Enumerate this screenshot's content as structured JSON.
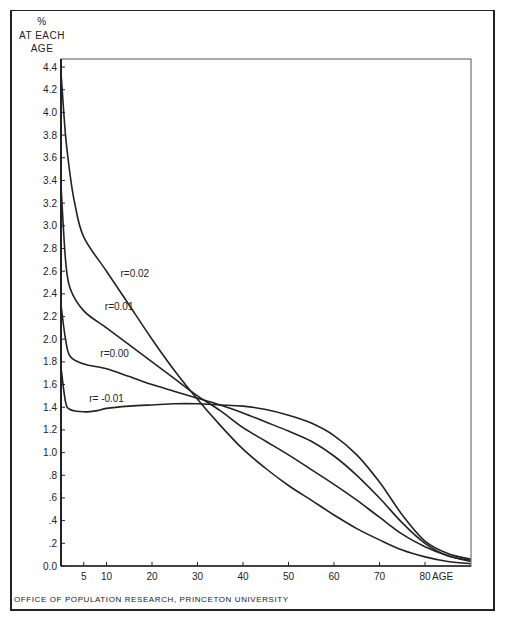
{
  "chart_data": {
    "type": "line",
    "title": "",
    "ylabel": "% AT EACH AGE",
    "ylabel_lines": [
      "%",
      "AT EACH",
      "AGE"
    ],
    "xlabel": "AGE",
    "xlim": [
      0,
      90
    ],
    "ylim": [
      0,
      4.4
    ],
    "grid": false,
    "x_ticks": [
      5,
      10,
      20,
      30,
      40,
      50,
      60,
      70,
      80
    ],
    "x_tick_labels": [
      "5",
      "10",
      "20",
      "30",
      "40",
      "50",
      "60",
      "70",
      "80"
    ],
    "y_ticks": [
      0.0,
      0.2,
      0.4,
      0.6,
      0.8,
      1.0,
      1.2,
      1.4,
      1.6,
      1.8,
      2.0,
      2.2,
      2.4,
      2.6,
      2.8,
      3.0,
      3.2,
      3.4,
      3.6,
      3.8,
      4.0,
      4.2,
      4.4
    ],
    "y_tick_labels": [
      "0.0",
      ".2",
      ".4",
      ".6",
      ".8",
      "1.0",
      "1.2",
      "1.4",
      "1.6",
      "1.8",
      "2.0",
      "2.2",
      "2.4",
      "2.6",
      "2.8",
      "3.0",
      "3.2",
      "3.4",
      "3.6",
      "3.8",
      "4.0",
      "4.2",
      "4.4"
    ],
    "legend": "inline curve labels",
    "series": [
      {
        "name": "r=0.02",
        "label_pos": {
          "age": 10,
          "value": 2.6
        },
        "x": [
          0,
          1,
          2,
          3,
          5,
          10,
          15,
          20,
          25,
          30,
          35,
          40,
          45,
          50,
          55,
          60,
          65,
          70,
          75,
          80,
          85,
          90
        ],
        "values": [
          4.35,
          3.8,
          3.45,
          3.2,
          2.9,
          2.6,
          2.3,
          2.0,
          1.72,
          1.47,
          1.24,
          1.03,
          0.86,
          0.71,
          0.58,
          0.45,
          0.33,
          0.23,
          0.14,
          0.08,
          0.04,
          0.02
        ]
      },
      {
        "name": "r=0.01",
        "label_pos": {
          "age": 7,
          "value": 2.3
        },
        "x": [
          0,
          1,
          2,
          5,
          10,
          15,
          20,
          25,
          30,
          35,
          40,
          45,
          50,
          55,
          60,
          65,
          70,
          75,
          80,
          85,
          90
        ],
        "values": [
          3.35,
          2.7,
          2.45,
          2.25,
          2.1,
          1.95,
          1.8,
          1.65,
          1.5,
          1.37,
          1.22,
          1.1,
          0.98,
          0.85,
          0.72,
          0.58,
          0.43,
          0.28,
          0.17,
          0.09,
          0.04
        ]
      },
      {
        "name": "r=0.00",
        "label_pos": {
          "age": 6,
          "value": 1.9
        },
        "x": [
          0,
          1,
          2,
          5,
          10,
          15,
          20,
          25,
          30,
          35,
          40,
          45,
          50,
          55,
          60,
          65,
          70,
          75,
          80,
          85,
          90
        ],
        "values": [
          2.3,
          2.0,
          1.85,
          1.78,
          1.74,
          1.67,
          1.6,
          1.54,
          1.48,
          1.42,
          1.35,
          1.27,
          1.19,
          1.1,
          0.97,
          0.8,
          0.6,
          0.38,
          0.2,
          0.09,
          0.05
        ]
      },
      {
        "name": "r=-0.01",
        "label_pos": {
          "age": 4,
          "value": 1.5
        },
        "x": [
          0,
          1,
          2,
          5,
          8,
          10,
          15,
          20,
          25,
          30,
          35,
          40,
          45,
          50,
          55,
          60,
          65,
          70,
          75,
          80,
          85,
          90
        ],
        "values": [
          1.75,
          1.45,
          1.38,
          1.36,
          1.37,
          1.39,
          1.41,
          1.42,
          1.43,
          1.43,
          1.42,
          1.41,
          1.38,
          1.33,
          1.26,
          1.15,
          0.98,
          0.74,
          0.45,
          0.22,
          0.11,
          0.06
        ]
      }
    ],
    "curve_labels": [
      "r=0.02",
      "r=0.01",
      "r=0.00",
      "r= -0.01"
    ],
    "source": "OFFICE OF POPULATION RESEARCH, PRINCETON UNIVERSITY"
  },
  "colors": {
    "ink": "#222222",
    "background": "#ffffff"
  }
}
